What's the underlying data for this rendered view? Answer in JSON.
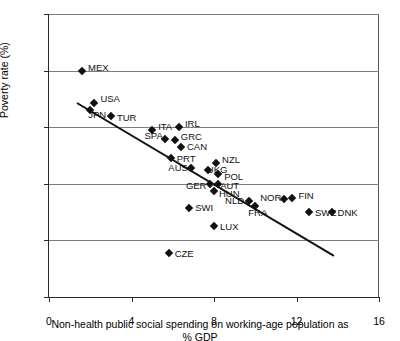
{
  "chart_data": {
    "type": "scatter",
    "title": "",
    "xlabel": "Non-health public social spending on working-age population as % GDP",
    "xlabel_line1": "Non-health public social spending on working-age population as",
    "xlabel_line2": "% GDP",
    "ylabel": "Poverty rate (%)",
    "xlim": [
      0,
      16
    ],
    "ylim": [
      0,
      20
    ],
    "xticks": [
      0,
      4,
      8,
      12,
      16
    ],
    "yticks": [
      0,
      4,
      8,
      12,
      16,
      20
    ],
    "xtick_labels": [
      "0",
      "4",
      "8",
      "12",
      "16"
    ],
    "ytick_labels": [
      "0",
      "4",
      "8",
      "12",
      "16",
      "20"
    ],
    "grid": "horizontal",
    "legend": "none",
    "marker": "diamond",
    "marker_color": "#111111",
    "points": [
      {
        "label": "MEX",
        "x": 1.6,
        "y": 16.0,
        "lx": 6,
        "ly": -4
      },
      {
        "label": "USA",
        "x": 2.2,
        "y": 13.7,
        "lx": 6,
        "ly": -5
      },
      {
        "label": "JPN",
        "x": 2.0,
        "y": 13.2,
        "lx": -2,
        "ly": 4
      },
      {
        "label": "TUR",
        "x": 3.0,
        "y": 12.8,
        "lx": 6,
        "ly": 1
      },
      {
        "label": "ITA",
        "x": 5.0,
        "y": 11.8,
        "lx": 6,
        "ly": -4
      },
      {
        "label": "IRL",
        "x": 6.3,
        "y": 12.0,
        "lx": 6,
        "ly": -4
      },
      {
        "label": "SPA",
        "x": 5.6,
        "y": 11.2,
        "lx": -20,
        "ly": -4
      },
      {
        "label": "GRC",
        "x": 6.1,
        "y": 11.1,
        "lx": 6,
        "ly": -4
      },
      {
        "label": "CAN",
        "x": 6.4,
        "y": 10.6,
        "lx": 6,
        "ly": -1
      },
      {
        "label": "PRT",
        "x": 5.9,
        "y": 9.8,
        "lx": 6,
        "ly": 0
      },
      {
        "label": "AUS",
        "x": 6.9,
        "y": 9.1,
        "lx": -23,
        "ly": -1
      },
      {
        "label": "NZL",
        "x": 8.1,
        "y": 9.5,
        "lx": 6,
        "ly": -4
      },
      {
        "label": "UKG",
        "x": 7.7,
        "y": 9.0,
        "lx": -1,
        "ly": -1
      },
      {
        "label": "POL",
        "x": 8.2,
        "y": 8.7,
        "lx": 6,
        "ly": 2
      },
      {
        "label": "GER",
        "x": 7.8,
        "y": 8.0,
        "lx": -24,
        "ly": 1
      },
      {
        "label": "AUT",
        "x": 8.2,
        "y": 8.0,
        "lx": 2,
        "ly": 1
      },
      {
        "label": "HUN",
        "x": 8.0,
        "y": 7.5,
        "lx": 5,
        "ly": 2
      },
      {
        "label": "SWI",
        "x": 6.8,
        "y": 6.3,
        "lx": 6,
        "ly": -1
      },
      {
        "label": "NLD",
        "x": 9.7,
        "y": 6.8,
        "lx": -24,
        "ly": -1
      },
      {
        "label": "FRA",
        "x": 10.0,
        "y": 6.4,
        "lx": -7,
        "ly": 6
      },
      {
        "label": "NOR",
        "x": 11.4,
        "y": 6.9,
        "lx": -24,
        "ly": -2
      },
      {
        "label": "FIN",
        "x": 11.8,
        "y": 7.0,
        "lx": 6,
        "ly": -3
      },
      {
        "label": "SWE",
        "x": 12.6,
        "y": 6.0,
        "lx": 6,
        "ly": 0
      },
      {
        "label": "DNK",
        "x": 13.7,
        "y": 6.0,
        "lx": 6,
        "ly": 0
      },
      {
        "label": "LUX",
        "x": 8.0,
        "y": 5.0,
        "lx": 6,
        "ly": 0
      },
      {
        "label": "CZE",
        "x": 5.8,
        "y": 3.1,
        "lx": 6,
        "ly": 0
      }
    ],
    "trendline": {
      "x1": 1.35,
      "y1": 13.8,
      "x2": 13.8,
      "y2": 3.0
    }
  }
}
